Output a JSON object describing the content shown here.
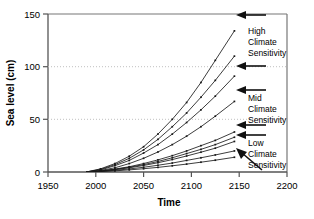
{
  "chart_data": {
    "type": "line",
    "title": "",
    "xlabel": "Time",
    "ylabel": "Sea level (cm)",
    "xlim": [
      1950,
      2200
    ],
    "ylim": [
      0,
      150
    ],
    "xticks": [
      1950,
      2000,
      2050,
      2100,
      2150,
      2200
    ],
    "yticks": [
      0,
      50,
      100,
      150
    ],
    "grid": "horizontal-dotted-at-50-100",
    "legend_position": "inline-annotations-right",
    "x": [
      1990,
      2005,
      2020,
      2035,
      2050,
      2065,
      2080,
      2095,
      2110,
      2125,
      2145
    ],
    "series": [
      {
        "name": "High climate sensitivity, high scenario",
        "values": [
          0,
          3,
          8,
          15,
          24,
          36,
          50,
          66,
          85,
          106,
          134
        ]
      },
      {
        "name": "High climate sensitivity, mid scenario",
        "values": [
          0,
          2.5,
          7,
          13,
          21,
          31,
          43,
          56,
          71,
          87,
          110
        ]
      },
      {
        "name": "High climate sensitivity, low scenario",
        "values": [
          0,
          2,
          6,
          11,
          18,
          26,
          36,
          47,
          59,
          72,
          91
        ]
      },
      {
        "name": "Mid climate sensitivity, high scenario",
        "values": [
          0,
          1.5,
          4,
          8,
          13,
          19,
          26,
          34,
          43,
          53,
          67
        ]
      },
      {
        "name": "Mid climate sensitivity, mid scenario",
        "values": [
          0,
          1,
          2.8,
          5,
          8,
          11.5,
          15.5,
          20,
          25,
          30,
          38
        ]
      },
      {
        "name": "Mid climate sensitivity, low scenario",
        "values": [
          0,
          0.9,
          2.5,
          4.5,
          7,
          10,
          13.5,
          17.5,
          21.5,
          26,
          33
        ]
      },
      {
        "name": "Low climate sensitivity, high scenario",
        "values": [
          0,
          0.8,
          2.2,
          4,
          6.2,
          8.8,
          11.8,
          15.2,
          18.8,
          22.6,
          29
        ]
      },
      {
        "name": "Low climate sensitivity, mid scenario",
        "values": [
          0,
          0.6,
          1.6,
          2.9,
          4.5,
          6.4,
          8.5,
          11,
          13.5,
          16.2,
          20
        ]
      },
      {
        "name": "Low climate sensitivity, low scenario",
        "values": [
          0,
          0.4,
          1.1,
          2.0,
          3.1,
          4.4,
          5.9,
          7.5,
          9.3,
          11.2,
          14
        ]
      }
    ],
    "annotations": [
      {
        "id": "high",
        "text_lines": [
          "High",
          "Climate",
          "Sensitivity"
        ],
        "arrow_targets_y": [
          148,
          105
        ],
        "text_x": 2165,
        "text_y_top": 132
      },
      {
        "id": "mid",
        "text_lines": [
          "Mid",
          "Climate",
          "Sensitivity"
        ],
        "arrow_targets_y": [
          82
        ],
        "text_x": 2165,
        "text_y_top": 70
      },
      {
        "id": "low",
        "text_lines": [
          "Low",
          "Climate",
          "Sensitivity"
        ],
        "arrow_targets_y": [
          48,
          40
        ],
        "text_x": 2165,
        "text_y_top": 30,
        "extra_arrow": "diagonal-down-left"
      }
    ]
  },
  "axes": {
    "y_label": "Sea level (cm)",
    "x_label": "Time",
    "y_ticks": [
      "0",
      "50",
      "100",
      "150"
    ],
    "x_ticks": [
      "1950",
      "2000",
      "2050",
      "2100",
      "2150",
      "2200"
    ]
  },
  "annotations": {
    "high": {
      "line1": "High",
      "line2": "Climate",
      "line3": "Sensitivity"
    },
    "mid": {
      "line1": "Mid",
      "line2": "Climate",
      "line3": "Sensitivity"
    },
    "low": {
      "line1": "Low",
      "line2": "Climate",
      "line3": "Sensitivity"
    }
  },
  "colors": {
    "axis": "#555555",
    "curve": "#1a1a1a",
    "grid": "#bbbbbb",
    "text": "#000000",
    "arrow": "#111111"
  }
}
